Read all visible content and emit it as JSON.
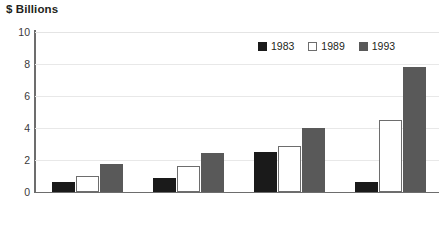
{
  "chart_data": {
    "type": "bar",
    "title": "$ Billions",
    "xlabel": "",
    "ylabel": "$ Billions",
    "categories": [
      "Other",
      "Television",
      "Theater",
      "Video"
    ],
    "series": [
      {
        "name": "1983",
        "color": "#1a1a1a",
        "values": [
          0.6,
          0.85,
          2.5,
          0.6
        ]
      },
      {
        "name": "1989",
        "color": "#ffffff",
        "values": [
          1.0,
          1.65,
          2.9,
          4.5
        ]
      },
      {
        "name": "1993",
        "color": "#595959",
        "values": [
          1.75,
          2.45,
          4.0,
          7.8
        ]
      }
    ],
    "ylim": [
      0,
      10
    ],
    "yticks": [
      "0",
      "2",
      "4",
      "6",
      "8",
      "10"
    ],
    "ytick_values": [
      0,
      2,
      4,
      6,
      8,
      10
    ],
    "grid": true,
    "legend_position": "top-right"
  }
}
